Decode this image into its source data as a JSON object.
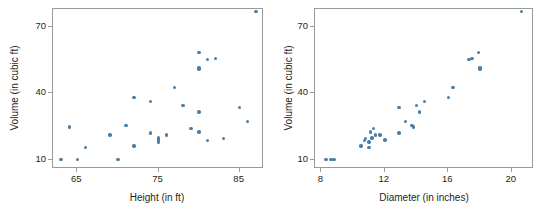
{
  "figure": {
    "background": "#ffffff",
    "point_color": "#4a7fa5",
    "frame_color": "#9a9a99"
  },
  "chart_data": [
    {
      "type": "scatter",
      "panel": "left",
      "title": "",
      "xlabel": "Height (in ft)",
      "ylabel": "Volume (in cubic ft)",
      "xlim": [
        62,
        88
      ],
      "ylim": [
        6,
        78
      ],
      "xticks": [
        65,
        75,
        85
      ],
      "yticks": [
        10,
        40,
        70
      ],
      "xtick_labels": [
        "65",
        "75",
        "85"
      ],
      "ytick_labels": [
        "10",
        "40",
        "70"
      ],
      "grid": false,
      "legend": "none",
      "n_points": 31,
      "x": [
        70,
        65,
        63,
        72,
        81,
        83,
        66,
        75,
        80,
        75,
        79,
        76,
        76,
        69,
        75,
        74,
        85,
        86,
        71,
        64,
        78,
        80,
        74,
        72,
        77,
        81,
        82,
        80,
        80,
        80,
        87
      ],
      "y": [
        10.3,
        10.3,
        10.2,
        16.4,
        18.8,
        19.7,
        15.6,
        18.2,
        22.6,
        19.9,
        24.2,
        21.0,
        21.4,
        21.3,
        19.1,
        22.2,
        33.8,
        27.4,
        25.7,
        24.9,
        34.5,
        31.7,
        36.3,
        38.3,
        42.6,
        55.4,
        55.7,
        58.3,
        51.5,
        51.0,
        77.0
      ]
    },
    {
      "type": "scatter",
      "panel": "right",
      "title": "",
      "xlabel": "Diameter (in inches)",
      "ylabel": "Volume (in cubic ft)",
      "xlim": [
        7.6,
        21.4
      ],
      "ylim": [
        6,
        78
      ],
      "xticks": [
        8,
        12,
        16,
        20
      ],
      "yticks": [
        10,
        40,
        70
      ],
      "xtick_labels": [
        "8",
        "12",
        "16",
        "20"
      ],
      "ytick_labels": [
        "10",
        "40",
        "70"
      ],
      "grid": false,
      "legend": "none",
      "n_points": 31,
      "x": [
        8.3,
        8.6,
        8.8,
        10.5,
        10.7,
        10.8,
        11.0,
        11.0,
        11.1,
        11.2,
        11.3,
        11.4,
        11.4,
        11.7,
        12.0,
        12.9,
        12.9,
        13.3,
        13.7,
        13.8,
        14.0,
        14.2,
        14.5,
        16.0,
        16.3,
        17.3,
        17.5,
        17.9,
        18.0,
        18.0,
        20.6
      ],
      "y": [
        10.3,
        10.3,
        10.2,
        16.4,
        18.8,
        19.7,
        15.6,
        18.2,
        22.6,
        19.9,
        24.2,
        21.0,
        21.4,
        21.3,
        19.1,
        22.2,
        33.8,
        27.4,
        25.7,
        24.9,
        34.5,
        31.7,
        36.3,
        38.3,
        42.6,
        55.4,
        55.7,
        58.3,
        51.5,
        51.0,
        77.0
      ]
    }
  ]
}
